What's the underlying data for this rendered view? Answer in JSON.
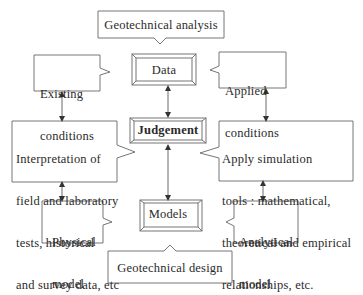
{
  "diagram": {
    "title_top": "Geotechnical analysis",
    "title_bottom": "Geotechnical design",
    "center_column": {
      "data": "Data",
      "judgement": "Judgement",
      "models": "Models"
    },
    "left_column": {
      "existing_line1": "Existing",
      "existing_line2": "conditions",
      "interp_line1": "Interpretation of",
      "interp_line2": "field and laboratory",
      "interp_line3": "tests, historical",
      "interp_line4": "and survey data, etc",
      "physical_line1": "Physical",
      "physical_line2": "model"
    },
    "right_column": {
      "applied_line1": "Applied",
      "applied_line2": "conditions",
      "apply_line1": "Apply simulation",
      "apply_line2": "tools : mathematical,",
      "apply_line3": "theoretical and empirical",
      "apply_line4": "relationships, etc.",
      "analytical_line1": "Analytical",
      "analytical_line2": "model"
    },
    "connections": [
      {
        "from": "Existing conditions",
        "to": "Interpretation of field and laboratory tests",
        "type": "bidirectional"
      },
      {
        "from": "Interpretation of field and laboratory tests",
        "to": "Physical model",
        "type": "bidirectional"
      },
      {
        "from": "Data",
        "to": "Judgement",
        "type": "bidirectional"
      },
      {
        "from": "Judgement",
        "to": "Models",
        "type": "bidirectional"
      },
      {
        "from": "Applied conditions",
        "to": "Apply simulation tools",
        "type": "bidirectional"
      },
      {
        "from": "Apply simulation tools",
        "to": "Analytical model",
        "type": "bidirectional"
      }
    ],
    "colors": {
      "line": "#555555",
      "text": "#2a2a2a",
      "background": "#ffffff"
    }
  }
}
